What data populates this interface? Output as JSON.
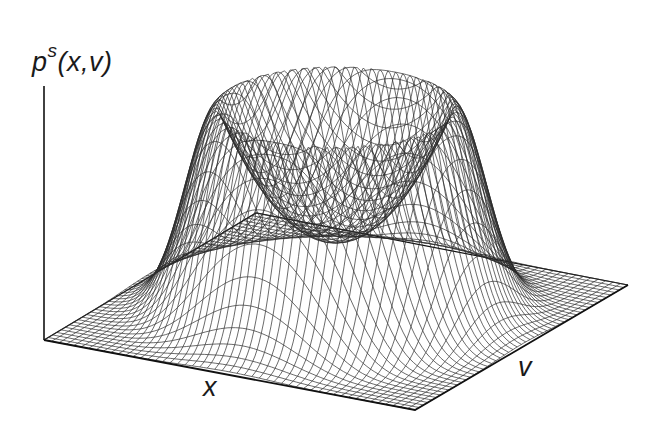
{
  "chart_data": {
    "type": "surface-wireframe",
    "title": "",
    "zlabel": "p^s(x,v)",
    "zlabel_base": "p",
    "zlabel_sup": "s",
    "zlabel_args": "(x,v)",
    "xlabel": "x",
    "ylabel": "v",
    "grid": {
      "rows": 50,
      "cols": 50
    },
    "surface": {
      "shape": "ring",
      "ring_radius": 0.55,
      "ring_width": 0.22,
      "peak_height": 1.0,
      "center_height": 0.35
    },
    "axes_ticks": "none",
    "legend": "none",
    "colors": {
      "line": "#2b2b2b",
      "axis": "#111111",
      "background": "#ffffff"
    }
  }
}
